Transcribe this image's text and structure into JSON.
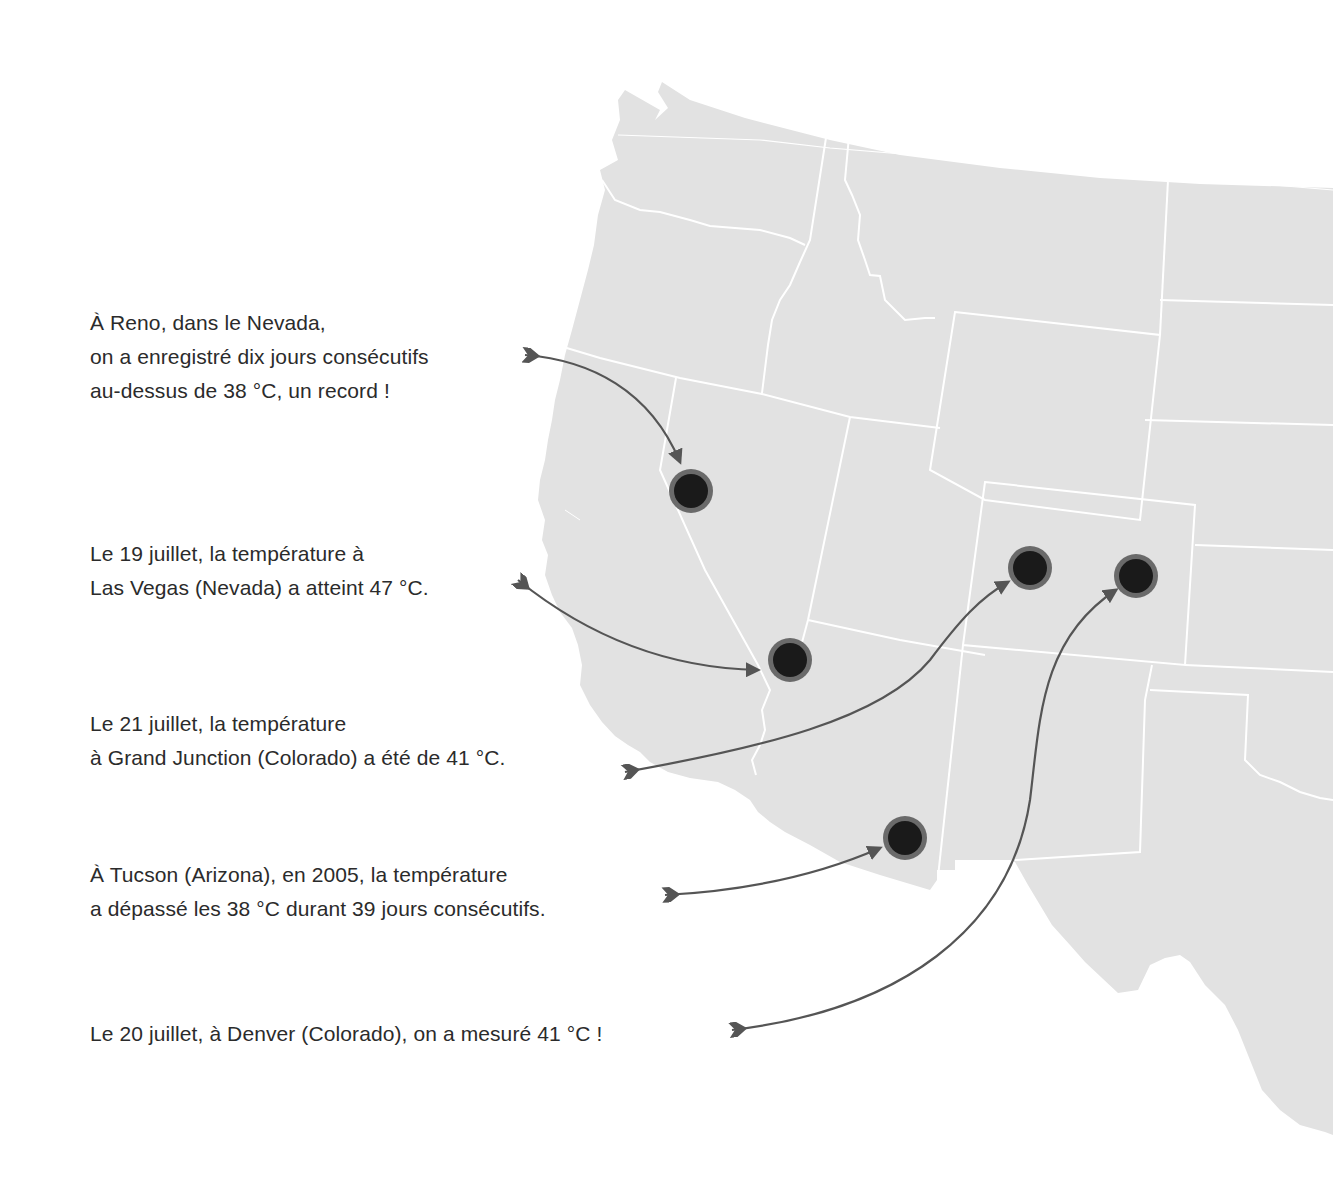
{
  "colors": {
    "land": "#e2e2e2",
    "borders": "#ffffff",
    "marker_fill": "#1a1a1a",
    "marker_ring": "#6a6a6a",
    "arrow": "#555555",
    "text": "#2b2b2b",
    "background": "#ffffff"
  },
  "annotations": [
    {
      "id": "reno",
      "lines": [
        "À Reno, dans le Nevada,",
        "on a enregistré dix jours consécutifs",
        "au-dessus de 38 °C, un record !"
      ],
      "city": "Reno",
      "state": "Nevada",
      "temperature_c": 38
    },
    {
      "id": "las-vegas",
      "lines": [
        "Le 19 juillet, la température à",
        "Las Vegas (Nevada) a atteint 47 °C."
      ],
      "city": "Las Vegas",
      "state": "Nevada",
      "temperature_c": 47
    },
    {
      "id": "grand-junction",
      "lines": [
        "Le 21 juillet, la température",
        "à Grand Junction (Colorado) a été de 41 °C."
      ],
      "city": "Grand Junction",
      "state": "Colorado",
      "temperature_c": 41
    },
    {
      "id": "tucson",
      "lines": [
        "À Tucson (Arizona), en 2005, la température",
        "a dépassé les 38 °C durant 39 jours consécutifs."
      ],
      "city": "Tucson",
      "state": "Arizona",
      "temperature_c": 38
    },
    {
      "id": "denver",
      "lines": [
        "Le 20 juillet, à Denver (Colorado), on a mesuré 41 °C !"
      ],
      "city": "Denver",
      "state": "Colorado",
      "temperature_c": 41
    }
  ],
  "markers": [
    {
      "city": "Reno",
      "x": 691,
      "y": 491
    },
    {
      "city": "Las Vegas",
      "x": 790,
      "y": 660
    },
    {
      "city": "Grand Junction",
      "x": 1030,
      "y": 568
    },
    {
      "city": "Denver",
      "x": 1136,
      "y": 576
    },
    {
      "city": "Tucson",
      "x": 905,
      "y": 838
    }
  ]
}
